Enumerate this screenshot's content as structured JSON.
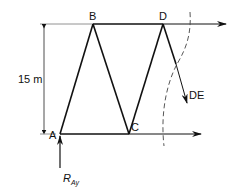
{
  "diagram": {
    "type": "truss-section",
    "nodes": [
      {
        "id": "A",
        "label": "A"
      },
      {
        "id": "B",
        "label": "B"
      },
      {
        "id": "C",
        "label": "C"
      },
      {
        "id": "D",
        "label": "D"
      }
    ],
    "members": [
      {
        "from": "A",
        "to": "B"
      },
      {
        "from": "B",
        "to": "C"
      },
      {
        "from": "C",
        "to": "D"
      },
      {
        "from": "B",
        "to": "D"
      },
      {
        "from": "A",
        "to": "C"
      }
    ],
    "dimension": {
      "label": "15 m"
    },
    "forces": {
      "top_chord": "top-chord-force",
      "bottom_chord": "bottom-chord-force",
      "diagonal": {
        "label": "DE"
      },
      "reaction": {
        "label": "R",
        "subscript": "Ay"
      }
    },
    "section_cut": "dashed"
  }
}
